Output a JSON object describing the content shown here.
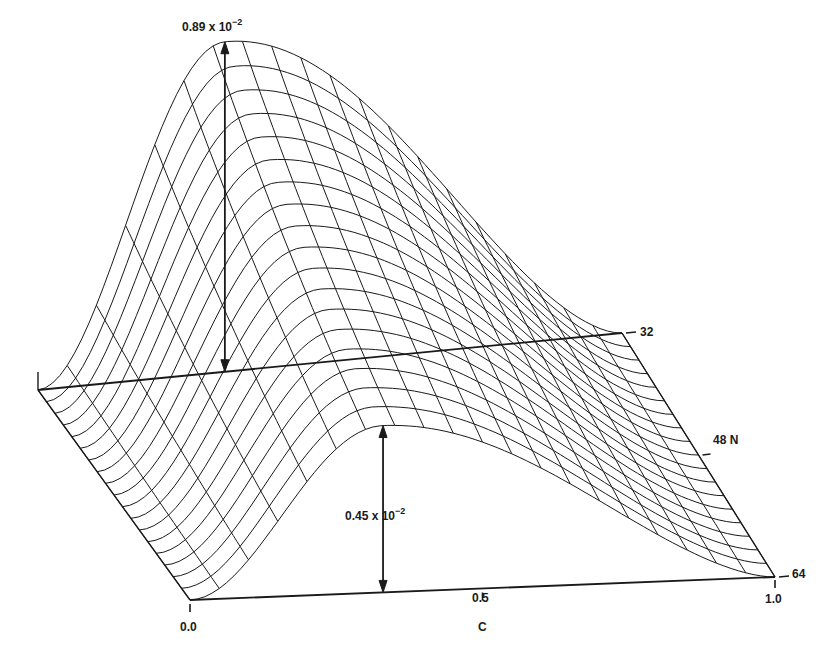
{
  "chart_data": {
    "type": "surface-3d-wireframe",
    "title": "",
    "x_axis": {
      "label": "C",
      "ticks": [
        "0.0",
        "0.5",
        "1.0"
      ],
      "range": [
        0.0,
        1.0
      ]
    },
    "y_axis": {
      "label": "N",
      "ticks": [
        "32",
        "48",
        "64"
      ],
      "range": [
        32,
        64
      ]
    },
    "z_axis": {
      "label": "",
      "range": [
        0,
        0.0089
      ]
    },
    "annotations": [
      {
        "text_mantissa": "0.89 x 10",
        "text_exponent": "−2",
        "value": 0.0089,
        "at": {
          "C": 0.32,
          "N": 32
        },
        "note": "peak height at N = 32"
      },
      {
        "text_mantissa": "0.45 x 10",
        "text_exponent": "−2",
        "value": 0.0045,
        "at": {
          "C": 0.33,
          "N": 64
        },
        "note": "peak height at N = 64"
      }
    ],
    "series": [
      {
        "name": "N=32",
        "N": 32,
        "peak_C": 0.32,
        "peak_value": 0.0089
      },
      {
        "name": "N=48",
        "N": 48,
        "peak_C": 0.33,
        "peak_value": 0.0064
      },
      {
        "name": "N=64",
        "N": 64,
        "peak_C": 0.33,
        "peak_value": 0.0045
      }
    ],
    "grid": {
      "C_lines": 20,
      "N_lines": 18
    }
  },
  "labels": {
    "top_annotation": {
      "mantissa": "0.89 x 10",
      "exponent": "−2"
    },
    "bottom_annotation": {
      "mantissa": "0.45 x 10",
      "exponent": "−2"
    },
    "n32": "32",
    "n48": "48 N",
    "n64": "64",
    "c00": "0.0",
    "c05": "0.5",
    "c10": "1.0",
    "c_axis": "C"
  }
}
